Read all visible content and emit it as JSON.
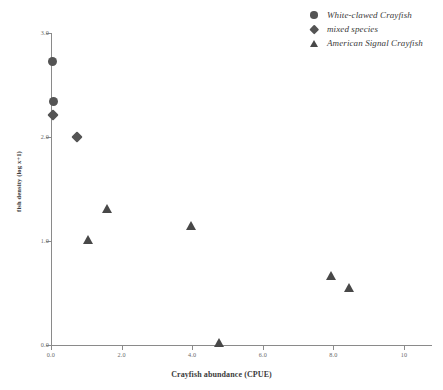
{
  "chart_data": {
    "type": "scatter",
    "title": "",
    "xlabel": "Crayfish abundance (CPUE)",
    "ylabel": "fish density (log x+1)",
    "xlim": [
      -0.35,
      10.8
    ],
    "ylim": [
      0.0,
      3.0
    ],
    "xticks": [
      "0.0",
      "2.0",
      "4.0",
      "6.0",
      "8.0",
      "10"
    ],
    "xtick_values": [
      0.0,
      2.0,
      4.0,
      6.0,
      8.0,
      10.0
    ],
    "yticks": [
      "3.0",
      "2.0",
      "1.0",
      "0.0"
    ],
    "ytick_values": [
      3.0,
      2.0,
      1.0,
      0.0
    ],
    "grid": false,
    "legend_position": "top-right",
    "marker_color": "#545454",
    "axis_color": "#8a8a8a",
    "series": [
      {
        "name": "White-clawed Crayfish",
        "marker": "circle",
        "points": [
          {
            "x": 0.03,
            "y": 2.73
          },
          {
            "x": 0.06,
            "y": 2.34
          }
        ]
      },
      {
        "name": "mixed species",
        "marker": "diamond",
        "points": [
          {
            "x": 0.06,
            "y": 2.21
          },
          {
            "x": 0.74,
            "y": 2.0
          }
        ]
      },
      {
        "name": "American Signal Crayfish",
        "marker": "triangle",
        "points": [
          {
            "x": 1.05,
            "y": 1.01
          },
          {
            "x": 1.59,
            "y": 1.31
          },
          {
            "x": 3.98,
            "y": 1.14
          },
          {
            "x": 4.76,
            "y": 0.02
          },
          {
            "x": 7.95,
            "y": 0.66
          },
          {
            "x": 8.45,
            "y": 0.55
          }
        ]
      }
    ]
  },
  "legend": {
    "items": [
      {
        "label": "White-clawed Crayfish",
        "marker": "circle"
      },
      {
        "label": "mixed species",
        "marker": "diamond"
      },
      {
        "label": "American Signal Crayfish",
        "marker": "triangle"
      }
    ]
  }
}
